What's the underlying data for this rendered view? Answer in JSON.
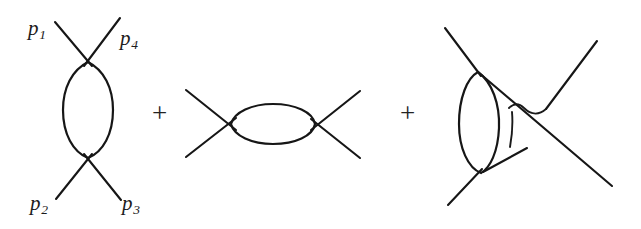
{
  "figure": {
    "background_color": "#ffffff",
    "line_color": "#161616"
  },
  "operators": [
    {
      "name": "plus-1",
      "symbol": "+",
      "x": 152,
      "y": 100
    },
    {
      "name": "plus-2",
      "symbol": "+",
      "x": 400,
      "y": 100
    }
  ],
  "momentum_labels": [
    {
      "id": "p1",
      "base": "p",
      "subscript": "1",
      "x": 28,
      "y": 18,
      "diagram": "s-channel-bubble",
      "leg": "incoming-upper-left"
    },
    {
      "id": "p4",
      "base": "p",
      "subscript": "4",
      "x": 120,
      "y": 28,
      "diagram": "s-channel-bubble",
      "leg": "outgoing-upper-right"
    },
    {
      "id": "p2",
      "base": "p",
      "subscript": "2",
      "x": 30,
      "y": 193,
      "diagram": "s-channel-bubble",
      "leg": "incoming-lower-left"
    },
    {
      "id": "p3",
      "base": "p",
      "subscript": "3",
      "x": 122,
      "y": 193,
      "diagram": "s-channel-bubble",
      "leg": "outgoing-lower-right"
    }
  ],
  "diagrams": [
    {
      "id": "s-channel-bubble",
      "name": "s-channel-bubble-diagram",
      "loop_orientation": "vertical",
      "loop_center": {
        "x": 88,
        "y": 110
      },
      "loop_radii": {
        "rx": 24,
        "ry": 48
      },
      "vertices": [
        {
          "x": 88,
          "y": 62
        },
        {
          "x": 88,
          "y": 158
        }
      ],
      "external_legs": 4
    },
    {
      "id": "t-channel-bubble",
      "name": "t-channel-bubble-diagram",
      "loop_orientation": "horizontal",
      "loop_center": {
        "x": 273,
        "y": 124
      },
      "loop_radii": {
        "rx": 42,
        "ry": 20
      },
      "vertices": [
        {
          "x": 231,
          "y": 124
        },
        {
          "x": 315,
          "y": 124
        }
      ],
      "external_legs": 4
    },
    {
      "id": "crossed-box",
      "name": "crossed-box-diagram",
      "loop_orientation": "vertical",
      "loop_center": {
        "x": 482,
        "y": 121
      },
      "loop_radii": {
        "rx": 24,
        "ry": 51
      },
      "vertices": [
        {
          "x": 478,
          "y": 72
        },
        {
          "x": 481,
          "y": 173
        },
        {
          "x": 545,
          "y": 117
        }
      ],
      "external_legs": 4,
      "has_line_hop": true
    }
  ]
}
